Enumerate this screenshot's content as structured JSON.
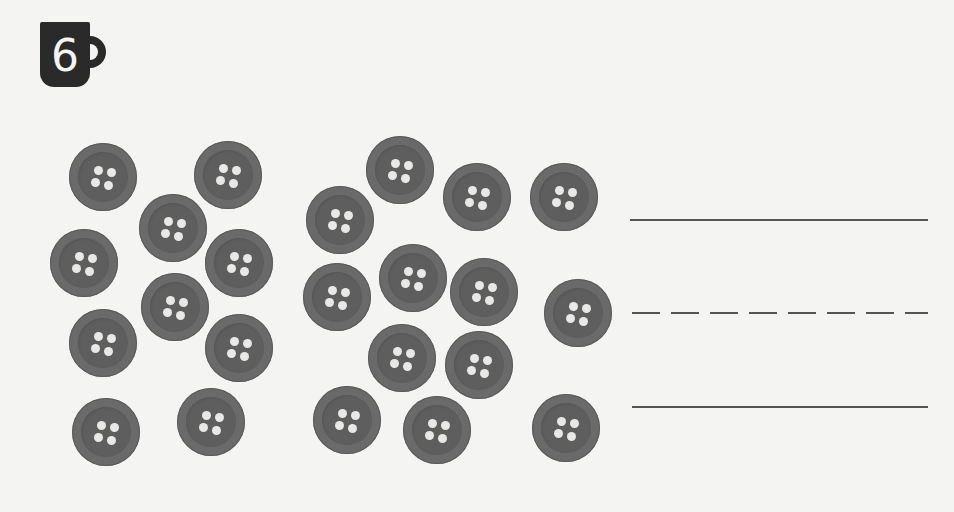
{
  "exercise": {
    "number": "6",
    "icon": "mug-icon"
  },
  "buttons": {
    "group_left": {
      "count": 10,
      "positions": [
        [
          103,
          177
        ],
        [
          228,
          175
        ],
        [
          173,
          228
        ],
        [
          84,
          263
        ],
        [
          239,
          263
        ],
        [
          175,
          307
        ],
        [
          103,
          343
        ],
        [
          239,
          348
        ],
        [
          106,
          432
        ],
        [
          211,
          422
        ]
      ]
    },
    "group_middle": {
      "count": 13,
      "positions": [
        [
          400,
          170
        ],
        [
          477,
          197
        ],
        [
          564,
          197
        ],
        [
          340,
          220
        ],
        [
          337,
          297
        ],
        [
          413,
          278
        ],
        [
          484,
          292
        ],
        [
          578,
          313
        ],
        [
          402,
          358
        ],
        [
          479,
          365
        ],
        [
          347,
          420
        ],
        [
          437,
          430
        ],
        [
          566,
          428
        ]
      ]
    }
  },
  "writing_lines": {
    "top": "solid",
    "middle": "dashed",
    "bottom": "solid"
  },
  "colors": {
    "background": "#f4f4f2",
    "button": "#6a6a6a",
    "hole": "#e8e8e6",
    "line": "#555555"
  }
}
